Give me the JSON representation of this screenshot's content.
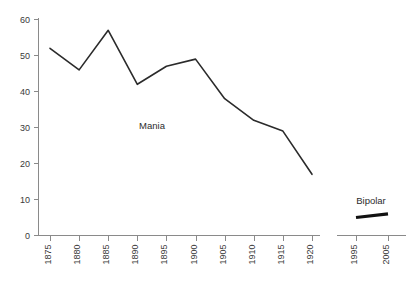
{
  "chart_data": {
    "type": "line",
    "title": "",
    "xlabel": "",
    "ylabel": "",
    "ylim": [
      0,
      60
    ],
    "yticks": [
      0,
      10,
      20,
      30,
      40,
      50,
      60
    ],
    "grid": false,
    "legend": "inline-annotations",
    "panels": [
      {
        "name": "mania-panel",
        "series_label": "Mania",
        "x": [
          1875,
          1880,
          1885,
          1890,
          1895,
          1900,
          1905,
          1910,
          1915,
          1920
        ],
        "xtick_labels": [
          "1875",
          "1880",
          "1885",
          "1890",
          "1895",
          "1900",
          "1905",
          "1910",
          "1915",
          "1920"
        ],
        "values": [
          52,
          46,
          57,
          42,
          47,
          49,
          38,
          32,
          29,
          17
        ]
      },
      {
        "name": "bipolar-panel",
        "series_label": "Bipolar",
        "x": [
          1995,
          2005
        ],
        "xtick_labels": [
          "1995",
          "2005"
        ],
        "values": [
          5,
          6
        ]
      }
    ]
  },
  "axis": {
    "y_tick_labels": [
      "60",
      "50",
      "40",
      "30",
      "20",
      "10",
      "0"
    ]
  },
  "colors": {
    "mania_line": "#2b2b2b",
    "bipolar_line": "#111111",
    "axis": "#8a8a8a",
    "text": "#3a3a3a",
    "background": "#ffffff"
  }
}
